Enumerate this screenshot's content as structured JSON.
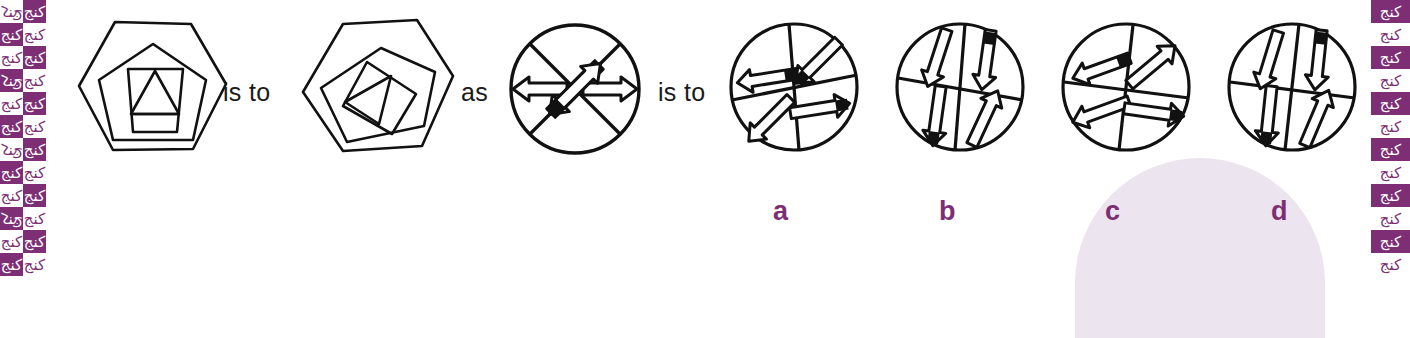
{
  "page": {
    "type": "non-verbal-reasoning-analogy",
    "background_color": "#ffffff",
    "ink_color": "#1a1a1a",
    "accent_color": "#7d2e74",
    "watermark_color": "#ece4ef"
  },
  "border": {
    "motif_glyph": "کنج",
    "fill_color": "#7d2e74",
    "blank_color": "#ffffff"
  },
  "connectors": {
    "first": "is to",
    "second": "as",
    "third": "is to"
  },
  "figures": [
    {
      "id": "stimulus-a",
      "kind": "nested-polygons",
      "description": "hexagon containing pentagon containing trapezium containing triangle",
      "rotation": "upright"
    },
    {
      "id": "stimulus-b",
      "kind": "nested-polygons",
      "description": "same nested polygons rotated clockwise",
      "rotation": "rotated"
    },
    {
      "id": "stimulus-c",
      "kind": "arrow-circle",
      "description": "circle split by an X with four outline arrows",
      "arrows": [
        "up-left",
        "left",
        "right",
        "down-right"
      ]
    }
  ],
  "options": [
    {
      "label": "a",
      "id": "option-a",
      "description": "circle split by vertical and tilted horizontal line",
      "arrows": [
        "up-right",
        "right",
        "down-left",
        "left"
      ]
    },
    {
      "label": "b",
      "id": "option-b",
      "description": "circle split by vertical and tilted horizontal line",
      "arrows": [
        "up-left",
        "up",
        "down",
        "down-right"
      ]
    },
    {
      "label": "c",
      "id": "option-c",
      "description": "circle split by vertical and tilted horizontal line",
      "arrows": [
        "up-left",
        "up-right",
        "down-left",
        "right"
      ]
    },
    {
      "label": "d",
      "id": "option-d",
      "description": "circle split by vertical and tilted horizontal line",
      "arrows": [
        "up-left",
        "up",
        "down",
        "down-right"
      ]
    }
  ]
}
